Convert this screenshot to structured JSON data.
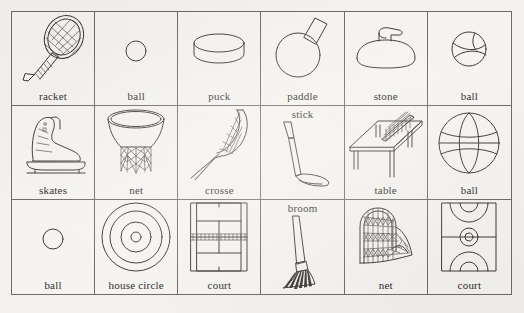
{
  "page": {
    "background_color": "#f4f2ee",
    "ink_color": "#3c3a36",
    "border_color": "#6f6b64",
    "columns": 6,
    "rows": 3
  },
  "cells": [
    {
      "id": "racket",
      "label": "racket",
      "icon": "tennis-racket-icon",
      "label_position": "bottom"
    },
    {
      "id": "ball-tennis",
      "label": "ball",
      "icon": "small-ball-icon",
      "label_position": "bottom"
    },
    {
      "id": "puck",
      "label": "puck",
      "icon": "hockey-puck-icon",
      "label_position": "bottom"
    },
    {
      "id": "paddle",
      "label": "paddle",
      "icon": "table-tennis-paddle-icon",
      "label_position": "bottom"
    },
    {
      "id": "stone",
      "label": "stone",
      "icon": "curling-stone-icon",
      "label_position": "bottom"
    },
    {
      "id": "ball-baseball",
      "label": "ball",
      "icon": "seamed-ball-icon",
      "label_position": "bottom"
    },
    {
      "id": "skates",
      "label": "skates",
      "icon": "ice-skate-icon",
      "label_position": "bottom"
    },
    {
      "id": "net-basket",
      "label": "net",
      "icon": "basketball-net-icon",
      "label_position": "bottom"
    },
    {
      "id": "crosse",
      "label": "crosse",
      "icon": "lacrosse-stick-icon",
      "label_position": "bottom"
    },
    {
      "id": "stick",
      "label": "stick",
      "icon": "golf-club-icon",
      "label_position": "top"
    },
    {
      "id": "table",
      "label": "table",
      "icon": "table-tennis-table-icon",
      "label_position": "bottom"
    },
    {
      "id": "ball-basket",
      "label": "ball",
      "icon": "basketball-icon",
      "label_position": "bottom"
    },
    {
      "id": "ball-golf",
      "label": "ball",
      "icon": "small-ball-icon",
      "label_position": "bottom"
    },
    {
      "id": "house-circle",
      "label": "house circle",
      "icon": "curling-house-icon",
      "label_position": "bottom"
    },
    {
      "id": "court-tennis",
      "label": "court",
      "icon": "tennis-court-icon",
      "label_position": "bottom"
    },
    {
      "id": "broom",
      "label": "broom",
      "icon": "curling-broom-icon",
      "label_position": "top"
    },
    {
      "id": "net-goal",
      "label": "net",
      "icon": "goal-net-icon",
      "label_position": "bottom"
    },
    {
      "id": "court-basket",
      "label": "court",
      "icon": "basketball-court-icon",
      "label_position": "bottom"
    }
  ]
}
